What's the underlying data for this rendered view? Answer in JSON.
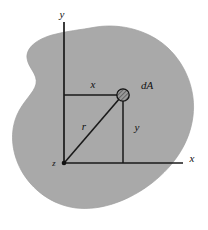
{
  "figure": {
    "background_color": "#ffffff",
    "region": {
      "name": "shaded-area",
      "fill_color": "#a9a9a9",
      "edge_color": "#9a9a9a",
      "description": "irregular closed plane region (blob) with a concave notch on the left side"
    },
    "axes": {
      "origin_label": "z",
      "y_axis_label": "y",
      "x_axis_label": "x",
      "axis_color": "#1a1a1a",
      "origin_dot_color": "#111111"
    },
    "labels": {
      "x_dimension": "x",
      "y_dimension": "y",
      "radial_dimension": "r",
      "element": "dA"
    },
    "element_marker": {
      "name": "dA-marker",
      "shape": "hatched-circle",
      "fill_color": "#8f8f8f",
      "stroke_color": "#111111"
    }
  },
  "geometry": {
    "origin": {
      "x": 64,
      "y": 163
    },
    "element_point": {
      "x": 123,
      "y": 95
    },
    "y_axis_top": {
      "x": 64,
      "y": 22
    },
    "x_axis_right": {
      "x": 183,
      "y": 163
    }
  }
}
